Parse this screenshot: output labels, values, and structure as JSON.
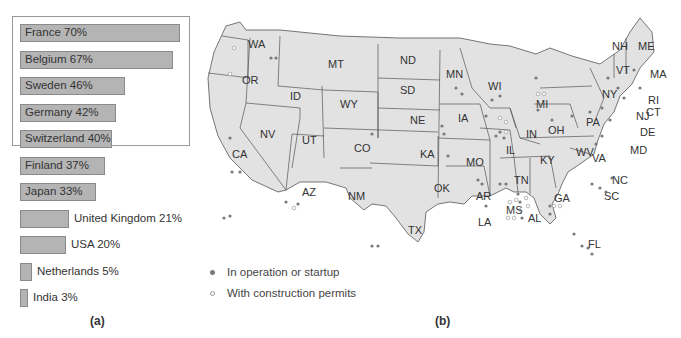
{
  "panel_a": {
    "caption": "(a)"
  },
  "panel_b": {
    "caption": "(b)"
  },
  "legend": {
    "items": [
      {
        "label": "In operation or startup",
        "style": "filled",
        "color": "#7a7a7a"
      },
      {
        "label": "With construction permits",
        "style": "hollow",
        "color": "#9a9a9a"
      }
    ]
  },
  "chart_data": [
    {
      "type": "bar",
      "orientation": "horizontal",
      "title": "",
      "xlabel": "",
      "ylabel": "",
      "categories": [
        "France",
        "Belgium",
        "Sweden",
        "Germany",
        "Switzerland",
        "Finland",
        "Japan",
        "United Kingdom",
        "USA",
        "Netherlands",
        "India"
      ],
      "values": [
        70,
        67,
        46,
        42,
        40,
        37,
        33,
        21,
        20,
        5,
        3
      ],
      "labels": [
        "France 70%",
        "Belgium 67%",
        "Sweden 46%",
        "Germany 42%",
        "Switzerland 40%",
        "Finland 37%",
        "Japan 33%",
        "United Kingdom 21%",
        "USA 20%",
        "Netherlands 5%",
        "India 3%"
      ],
      "units": "%",
      "xlim": [
        0,
        70
      ],
      "grid": false,
      "bar_color": "#b4b4b4",
      "caption": "(a)"
    },
    {
      "type": "map",
      "region": "United States",
      "caption": "(b)",
      "state_labels": [
        "WA",
        "OR",
        "ID",
        "MT",
        "ND",
        "SD",
        "WY",
        "NE",
        "NV",
        "UT",
        "CO",
        "CA",
        "KA",
        "AZ",
        "NM",
        "OK",
        "TX",
        "MN",
        "WI",
        "IA",
        "MO",
        "AR",
        "LA",
        "MI",
        "IL",
        "IN",
        "OH",
        "KY",
        "TN",
        "MS",
        "AL",
        "GA",
        "FL",
        "SC",
        "NC",
        "WV",
        "VA",
        "PA",
        "NY",
        "VT",
        "NH",
        "ME",
        "MA",
        "RI",
        "CT",
        "NJ",
        "DE",
        "MD"
      ],
      "legend": [
        "In operation or startup",
        "With construction permits"
      ]
    }
  ],
  "bars": [
    {
      "label": "France 70%",
      "width": 160,
      "inside": true
    },
    {
      "label": "Belgium 67%",
      "width": 153,
      "inside": true
    },
    {
      "label": "Sweden 46%",
      "width": 105,
      "inside": true
    },
    {
      "label": "Germany 42%",
      "width": 96,
      "inside": true
    },
    {
      "label": "Switzerland 40%",
      "width": 92,
      "inside": true
    },
    {
      "label": "Finland 37%",
      "width": 85,
      "inside": true
    },
    {
      "label": "Japan 33%",
      "width": 76,
      "inside": true
    },
    {
      "label": "United Kingdom 21%",
      "width": 49,
      "inside": false
    },
    {
      "label": "USA 20%",
      "width": 46,
      "inside": false
    },
    {
      "label": "Netherlands 5%",
      "width": 12,
      "inside": false
    },
    {
      "label": "India 3%",
      "width": 8,
      "inside": false
    }
  ]
}
